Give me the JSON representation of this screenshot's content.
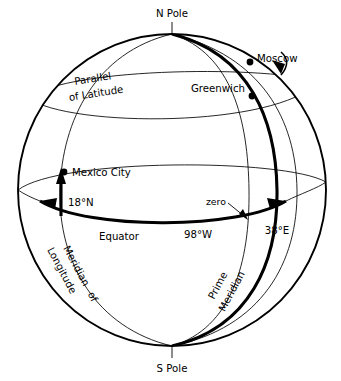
{
  "figure": {
    "background_color": "#ffffff",
    "line_color": "#000000"
  },
  "poles": {
    "north_label": "N Pole",
    "south_label": "S Pole"
  },
  "cities": [
    {
      "name": "Moscow",
      "label": "Moscow",
      "marker": "dot",
      "latitude_note": "",
      "longitude_label": "38°E"
    },
    {
      "name": "Greenwich",
      "label": "Greenwich",
      "marker": "dot",
      "latitude_note": "",
      "longitude_label": ""
    },
    {
      "name": "Mexico City",
      "label": "Mexico City",
      "marker": "dot",
      "latitude_note": "18°N",
      "longitude_label": "98°W"
    }
  ],
  "lines": {
    "equator": "Equator",
    "parallel_of_latitude_line1": "Parallel",
    "parallel_of_latitude_line2": "of  Latitude",
    "meridian_of_longitude_line1": "Meridian",
    "meridian_of_longitude_line2": "of",
    "meridian_of_longitude_line3": "Longitude",
    "prime_meridian_line1": "Prime",
    "prime_meridian_line2": "Meridian"
  },
  "annotations": {
    "zero": "zero",
    "latitude_arrow": "18°N",
    "longitude_west_arrow": "98°W",
    "longitude_east_arrow": "38°E"
  }
}
